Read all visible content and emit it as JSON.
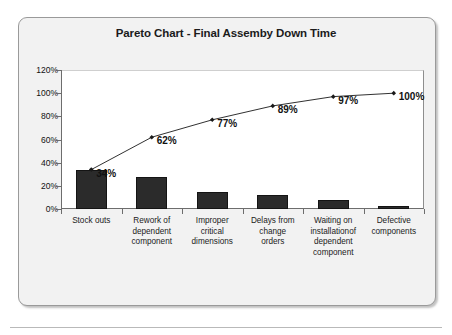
{
  "chart_data": {
    "type": "bar",
    "title": "Pareto Chart - Final Assemby Down Time",
    "xlabel": "",
    "ylabel": "",
    "ylim": [
      0,
      120
    ],
    "grid": false,
    "legend": "none",
    "categories": [
      "Stock outs",
      "Rework of dependent component",
      "Improper critical dimensions",
      "Delays from change orders",
      "Waiting on installationof dependent component",
      "Defective components"
    ],
    "category_lines": [
      [
        "Stock outs"
      ],
      [
        "Rework of",
        "dependent",
        "component"
      ],
      [
        "Improper",
        "critical",
        "dimensions"
      ],
      [
        "Delays from",
        "change",
        "orders"
      ],
      [
        "Waiting on",
        "installationof",
        "dependent",
        "component"
      ],
      [
        "Defective",
        "components"
      ]
    ],
    "series": [
      {
        "name": "Down time share",
        "type": "bar",
        "values": [
          34,
          28,
          15,
          12,
          8,
          3
        ]
      },
      {
        "name": "Cumulative percentage",
        "type": "line",
        "values": [
          34,
          62,
          77,
          89,
          97,
          100
        ]
      }
    ],
    "ytick_labels": [
      "0%",
      "20%",
      "40%",
      "60%",
      "80%",
      "100%",
      "120%"
    ],
    "ytick_values": [
      0,
      20,
      40,
      60,
      80,
      100,
      120
    ],
    "cumulative_labels": [
      "34%",
      "62%",
      "77%",
      "89%",
      "97%",
      "100%"
    ],
    "colors": {
      "bar": "#2b2b2b",
      "line": "#1a1a1a",
      "plot_background": "#ffffff",
      "frame_background": "#f2f2f2",
      "axis": "#6d6d6d",
      "text": "#1b1b1b"
    }
  }
}
